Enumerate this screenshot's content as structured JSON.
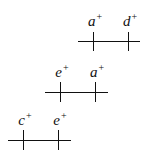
{
  "rows": [
    {
      "line": {
        "x1": 78,
        "x2": 140,
        "y": 41
      },
      "ticks": [
        {
          "x": 93,
          "label": "a",
          "sup": "+"
        },
        {
          "x": 128,
          "label": "d",
          "sup": "+"
        }
      ],
      "tick_top": 32,
      "tick_bottom": 51,
      "label_y": 12
    },
    {
      "line": {
        "x1": 45,
        "x2": 108,
        "y": 92
      },
      "ticks": [
        {
          "x": 60,
          "label": "e",
          "sup": "+"
        },
        {
          "x": 95,
          "label": "a",
          "sup": "+"
        }
      ],
      "tick_top": 82,
      "tick_bottom": 102,
      "label_y": 63
    },
    {
      "line": {
        "x1": 8,
        "x2": 71,
        "y": 140
      },
      "ticks": [
        {
          "x": 23,
          "label": "c",
          "sup": "+"
        },
        {
          "x": 58,
          "label": "e",
          "sup": "+"
        }
      ],
      "tick_top": 130,
      "tick_bottom": 150,
      "label_y": 111
    }
  ]
}
